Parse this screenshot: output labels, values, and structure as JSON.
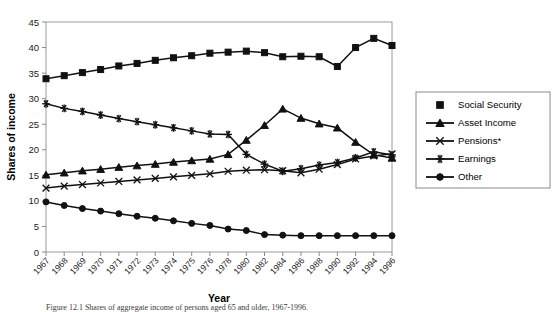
{
  "figure": {
    "xlabel": "Year",
    "ylabel": "Shares of income"
  },
  "axes": {
    "y_ticks": [
      "0",
      "5",
      "10",
      "15",
      "20",
      "25",
      "30",
      "35",
      "40",
      "45"
    ],
    "x_ticks": [
      "1967",
      "1968",
      "1969",
      "1970",
      "1971",
      "1972",
      "1973",
      "1974",
      "1975",
      "1976",
      "1978",
      "1980",
      "1982",
      "1984",
      "1986",
      "1988",
      "1990",
      "1992",
      "1994",
      "1996"
    ]
  },
  "legend": {
    "items": [
      {
        "label": "Social Security",
        "marker": "square-marker",
        "has_line": false
      },
      {
        "label": "Asset Income",
        "marker": "triangle-marker",
        "has_line": true
      },
      {
        "label": "Pensions*",
        "marker": "x-marker",
        "has_line": true
      },
      {
        "label": "Earnings",
        "marker": "asterisk-marker",
        "has_line": true
      },
      {
        "label": "Other",
        "marker": "circle-marker",
        "has_line": true
      }
    ]
  },
  "caption": {
    "text": "Figure 12.1  Shares of aggregate income of persons aged 65 and older, 1967-1996."
  },
  "chart_data": {
    "type": "line",
    "title": "",
    "xlabel": "Year",
    "ylabel": "Shares of income",
    "ylim": [
      0,
      45
    ],
    "grid": false,
    "legend_position": "right",
    "categories": [
      "1967",
      "1968",
      "1969",
      "1970",
      "1971",
      "1972",
      "1973",
      "1974",
      "1975",
      "1976",
      "1978",
      "1980",
      "1982",
      "1984",
      "1986",
      "1988",
      "1990",
      "1992",
      "1994",
      "1996"
    ],
    "series": [
      {
        "name": "Social Security",
        "marker": "square",
        "values": [
          33.9,
          34.5,
          35.1,
          35.7,
          36.4,
          36.9,
          37.5,
          38.0,
          38.4,
          38.9,
          39.1,
          39.3,
          39.0,
          38.2,
          38.3,
          38.2,
          36.3,
          40.0,
          41.8,
          40.4
        ]
      },
      {
        "name": "Asset Income",
        "marker": "triangle",
        "values": [
          15.1,
          15.5,
          15.9,
          16.2,
          16.6,
          16.9,
          17.2,
          17.6,
          17.9,
          18.2,
          19.1,
          21.9,
          24.8,
          28.0,
          26.2,
          25.1,
          24.3,
          21.5,
          19.0,
          18.4
        ]
      },
      {
        "name": "Pensions*",
        "marker": "x",
        "values": [
          12.5,
          12.9,
          13.2,
          13.5,
          13.8,
          14.1,
          14.4,
          14.7,
          15.0,
          15.3,
          15.8,
          16.0,
          16.1,
          15.9,
          15.5,
          16.2,
          17.1,
          18.2,
          18.8,
          19.2
        ]
      },
      {
        "name": "Earnings",
        "marker": "asterisk",
        "values": [
          29.0,
          28.1,
          27.5,
          26.8,
          26.1,
          25.5,
          24.9,
          24.3,
          23.7,
          23.1,
          23.0,
          19.1,
          17.2,
          15.8,
          16.3,
          17.0,
          17.5,
          18.4,
          19.6,
          19.0
        ]
      },
      {
        "name": "Other",
        "marker": "circle",
        "values": [
          9.8,
          9.1,
          8.5,
          8.0,
          7.5,
          7.0,
          6.6,
          6.1,
          5.6,
          5.2,
          4.5,
          4.2,
          3.4,
          3.3,
          3.2,
          3.2,
          3.2,
          3.2,
          3.2,
          3.2
        ]
      }
    ]
  }
}
